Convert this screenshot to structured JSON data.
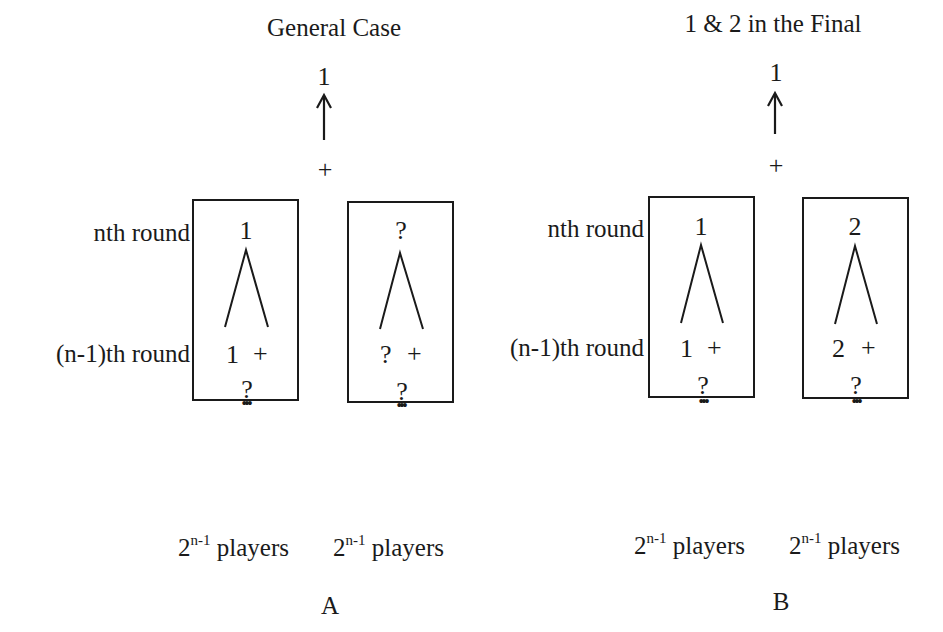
{
  "panels": [
    {
      "id": "A",
      "title": "General Case",
      "final_winner": "1",
      "final_plus": "+",
      "row_labels": {
        "nth": "nth round",
        "n_minus_1": "(n-1)th round"
      },
      "boxes": [
        {
          "top": "1",
          "mid_left": "1",
          "mid_plus": "+",
          "below": "?",
          "dots": "•••"
        },
        {
          "top": "?",
          "mid_left": "?",
          "mid_plus": "+",
          "below": "?",
          "dots": "•••"
        }
      ],
      "players": [
        {
          "base": "2",
          "exp": "n-1",
          "word": "players"
        },
        {
          "base": "2",
          "exp": "n-1",
          "word": "players"
        }
      ],
      "letter": "A"
    },
    {
      "id": "B",
      "title": "1 & 2 in the Final",
      "final_winner": "1",
      "final_plus": "+",
      "row_labels": {
        "nth": "nth round",
        "n_minus_1": "(n-1)th round"
      },
      "boxes": [
        {
          "top": "1",
          "mid_left": "1",
          "mid_plus": "+",
          "below": "?",
          "dots": "•••"
        },
        {
          "top": "2",
          "mid_left": "2",
          "mid_plus": "+",
          "below": "?",
          "dots": "•••"
        }
      ],
      "players": [
        {
          "base": "2",
          "exp": "n-1",
          "word": "players"
        },
        {
          "base": "2",
          "exp": "n-1",
          "word": "players"
        }
      ],
      "letter": "B"
    }
  ]
}
